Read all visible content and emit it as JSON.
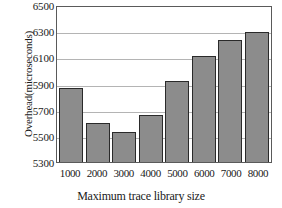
{
  "chart_data": {
    "type": "bar",
    "title": "",
    "xlabel": "Maximum trace library size",
    "ylabel": "Overhead(microseconds)",
    "categories": [
      "1000",
      "2000",
      "3000",
      "4000",
      "5000",
      "6000",
      "7000",
      "8000"
    ],
    "values": [
      5865,
      5600,
      5530,
      5660,
      5920,
      6110,
      6235,
      6295
    ],
    "ylim": [
      5300,
      6500
    ],
    "yticks": [
      "5300",
      "5500",
      "5700",
      "5900",
      "6100",
      "6300",
      "6500"
    ],
    "grid": true,
    "legend": "none",
    "series_color": "#8c8c8c",
    "bar_border_color": "#2a2a2a",
    "grid_color": "#b4b4b4",
    "frame_color": "#5a5a5a"
  }
}
